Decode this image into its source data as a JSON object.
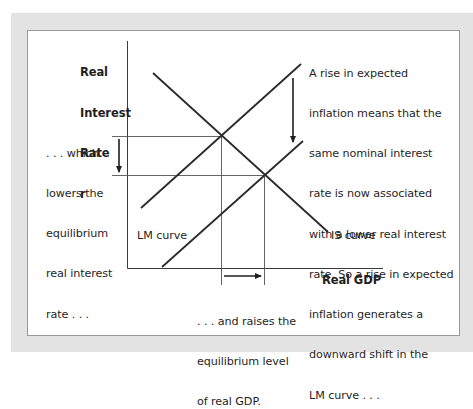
{
  "diagram": {
    "type": "IS-LM diagram",
    "y_axis_label_lines": [
      "Real",
      "Interest",
      "Rate",
      "r"
    ],
    "x_axis_label": "Real GDP",
    "curves": {
      "lm_label": "LM curve",
      "is_label": "IS curve"
    },
    "annotations": {
      "right_lines": [
        "A rise in expected",
        "inflation means that the",
        "same nominal interest",
        "rate is now associated",
        "with a lower real interest",
        "rate. So a rise in expected",
        "inflation generates a",
        "downward shift in the",
        "LM curve . . ."
      ],
      "left_lines": [
        ". . . which",
        "lowers the",
        "equilibrium",
        "real interest",
        "rate . . ."
      ],
      "bottom_lines": [
        ". . . and raises the",
        "equilibrium level",
        "of real GDP."
      ]
    },
    "colors": {
      "frame": "#e3e3e3",
      "panel": "#ffffff",
      "line": "#2a2a2a",
      "guide": "#555555"
    }
  }
}
